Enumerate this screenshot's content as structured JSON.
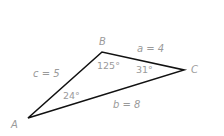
{
  "diagram": {
    "type": "triangle",
    "vertices": [
      {
        "name": "A",
        "x": 28,
        "y": 118
      },
      {
        "name": "B",
        "x": 102,
        "y": 52
      },
      {
        "name": "C",
        "x": 184,
        "y": 70
      }
    ],
    "vertex_labels": {
      "A": "A",
      "B": "B",
      "C": "C"
    },
    "side_labels": {
      "a": "a = 4",
      "b": "b = 8",
      "c": "c = 5"
    },
    "angle_labels": {
      "A": "24°",
      "B": "125°",
      "C": "31°"
    },
    "colors": {
      "line": "#111111",
      "label": "#9a9a9a"
    }
  }
}
